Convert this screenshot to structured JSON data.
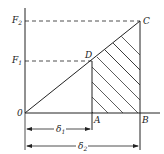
{
  "diagram": {
    "type": "force-displacement",
    "colors": {
      "line": "#222222",
      "background": "#ffffff"
    },
    "y_axis": {
      "origin_label": "0",
      "labels": [
        {
          "id": "F2",
          "base": "F",
          "sub": "2"
        },
        {
          "id": "F1",
          "base": "F",
          "sub": "1"
        }
      ]
    },
    "points": {
      "C": "C",
      "D": "D",
      "A": "A",
      "B": "B"
    },
    "dimensions": [
      {
        "id": "delta1",
        "base": "δ",
        "sub": "1"
      },
      {
        "id": "delta2",
        "base": "δ",
        "sub": "2"
      }
    ],
    "hatched_region": "trapezoid A-D-C-B"
  }
}
